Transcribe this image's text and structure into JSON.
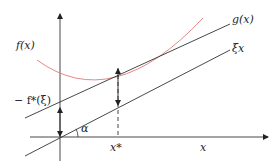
{
  "diagram": {
    "labels": {
      "f": "f(x)",
      "g": "g(x)",
      "xi": "ξx",
      "neg_conj": "− f*(ξ)",
      "alpha": "α",
      "x_star": "x*",
      "x_axis": "x"
    },
    "colors": {
      "curve": "#e07a7a",
      "lines": "#333333",
      "axes": "#333333"
    }
  }
}
